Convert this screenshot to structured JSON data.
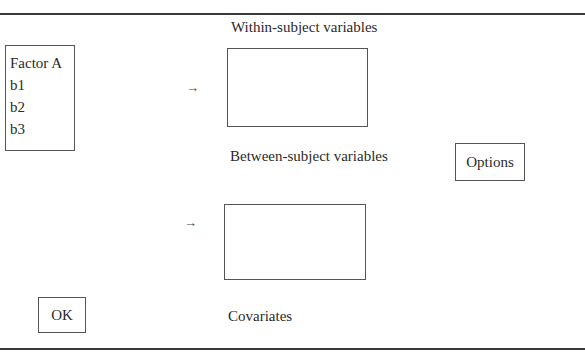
{
  "dialog": {
    "within_label": "Within-subject variables",
    "between_label": "Between-subject variables",
    "covariates_label": "Covariates",
    "source_list": {
      "items": [
        "Factor A",
        "b1",
        "b2",
        "b3"
      ]
    },
    "arrow_icon": "→",
    "buttons": {
      "options": "Options",
      "ok": "OK"
    }
  }
}
